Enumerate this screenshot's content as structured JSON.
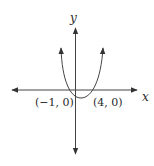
{
  "diagram": {
    "type": "parabola-graph",
    "axes": {
      "x_label": "x",
      "y_label": "y"
    },
    "points": [
      {
        "label": "(−1, 0)",
        "x": -1,
        "y": 0
      },
      {
        "label": "(4, 0)",
        "x": 4,
        "y": 0
      }
    ],
    "curve": "upward-opening parabola with x-intercepts at -1 and 4",
    "colors": {
      "line": "#333333",
      "text": "#2a2a2a",
      "background": "#ffffff"
    }
  }
}
